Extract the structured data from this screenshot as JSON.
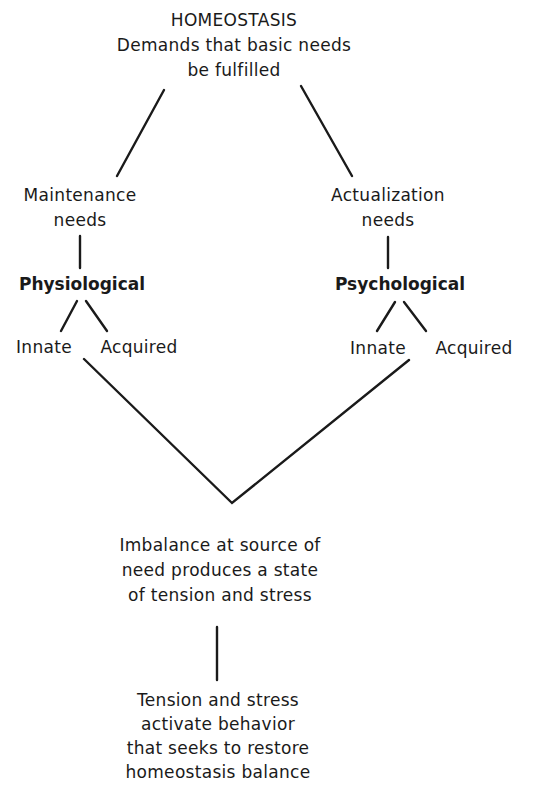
{
  "diagram": {
    "root": {
      "title": "HOMEOSTASIS",
      "lines": [
        "Demands that basic needs",
        "be fulfilled"
      ]
    },
    "left_branch": {
      "category": [
        "Maintenance",
        "needs"
      ],
      "type": "Physiological",
      "children": [
        "Innate",
        "Acquired"
      ]
    },
    "right_branch": {
      "category": [
        "Actualization",
        "needs"
      ],
      "type": "Psychological",
      "children": [
        "Innate",
        "Acquired"
      ]
    },
    "imbalance": {
      "lines": [
        "Imbalance at source of",
        "need produces a state",
        "of tension and stress"
      ]
    },
    "outcome": {
      "lines": [
        "Tension and stress",
        "activate behavior",
        "that seeks to restore",
        "homeostasis balance"
      ]
    }
  }
}
